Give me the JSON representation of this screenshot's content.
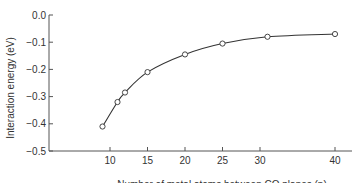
{
  "chart_data": {
    "type": "line",
    "title": "",
    "xlabel": "Number of metal atoms between CO planes (n)",
    "ylabel": "Interaction energy (eV)",
    "xlim": [
      4,
      42
    ],
    "ylim": [
      -0.5,
      0.0
    ],
    "x_ticks": [
      10,
      15,
      20,
      25,
      30,
      40
    ],
    "y_ticks": [
      0.0,
      -0.1,
      -0.2,
      -0.3,
      -0.4,
      -0.5
    ],
    "y_tick_labels": [
      "0.0",
      "−0.1",
      "−0.2",
      "−0.3",
      "−0.4",
      "−0.5"
    ],
    "grid": false,
    "legend": null,
    "series": [
      {
        "name": "Interaction energy",
        "marker": "open-circle",
        "line": "smooth",
        "x": [
          9,
          11,
          12,
          15,
          20,
          25,
          31,
          40
        ],
        "y": [
          -0.41,
          -0.32,
          -0.285,
          -0.21,
          -0.145,
          -0.105,
          -0.08,
          -0.07
        ]
      }
    ]
  },
  "colors": {
    "axis": "#555555",
    "line": "#333333",
    "marker_fill": "#ffffff"
  }
}
